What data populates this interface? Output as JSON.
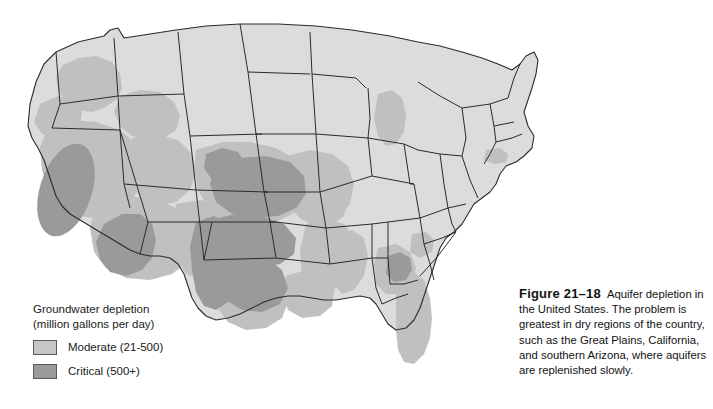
{
  "figure": {
    "number": "Figure 21–18",
    "caption": "Aquifer depletion in the United States. The problem is greatest in dry regions of the country, such as the Great Plains, California, and southern Arizona, where aquifers are replenished slowly."
  },
  "legend": {
    "title": "Groundwater depletion\n(million gallons per day)",
    "items": [
      {
        "label": "Moderate (21-500)",
        "color": "#c6c6c6",
        "swatch": "moderate-swatch"
      },
      {
        "label": "Critical (500+)",
        "color": "#9a9a9a",
        "swatch": "critical-swatch"
      }
    ]
  },
  "map": {
    "title": "United States aquifer depletion map",
    "base_color": "#dcdcdc",
    "moderate_color": "#c0c0c0",
    "critical_color": "#9a9a9a",
    "border_color": "#2b2b2b",
    "background_color": "#ffffff",
    "critical_regions": [
      "California Central Valley",
      "Southern Arizona",
      "Kansas / Ogallala High Plains",
      "Oklahoma panhandle and central Oklahoma",
      "Texas High Plains and central Texas",
      "Southwest Georgia"
    ],
    "moderate_regions": [
      "Eastern Washington and Oregon",
      "Southern Idaho / Snake River Plain",
      "Nevada and Utah basins",
      "Western Colorado and New Mexico",
      "Nebraska and Iowa",
      "Arkansas / Mississippi Delta",
      "Louisiana and eastern Texas coast",
      "Florida",
      "Michigan",
      "Long Island, New York"
    ]
  }
}
